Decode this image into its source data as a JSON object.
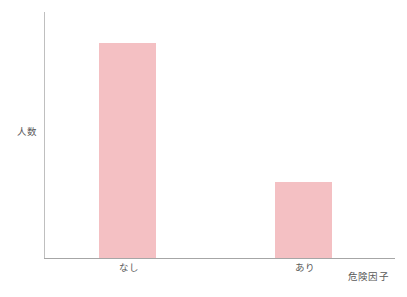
{
  "chart_data": {
    "type": "bar",
    "title": "",
    "subtitle": "",
    "categories": [
      "なし",
      "あり"
    ],
    "values": [
      100,
      35
    ],
    "xlabel": "危険因子",
    "ylabel": "人数",
    "ylim": [
      0,
      114
    ],
    "xtick_labels": [
      "なし",
      "あり"
    ],
    "ytick_labels": [],
    "grid": false,
    "legend": false,
    "legend_position": "none",
    "annotations": [],
    "series": [
      {
        "name": "人数",
        "values": [
          100,
          35
        ]
      }
    ],
    "colors": {
      "bar_fill": "#f4c0c3",
      "axis_line": "#bfbfbf",
      "axis_baseline": "#a6a6a6",
      "text": "#595959",
      "background": "#ffffff"
    }
  },
  "axes": {
    "y_label": "人数",
    "x_label": "危険因子"
  },
  "bars": [
    {
      "label": "なし",
      "value": 100,
      "height_pct": 87.4,
      "left_px": 54,
      "width_px": 57
    },
    {
      "label": "あり",
      "value": 35,
      "height_pct": 30.9,
      "left_px": 230,
      "width_px": 57
    }
  ]
}
